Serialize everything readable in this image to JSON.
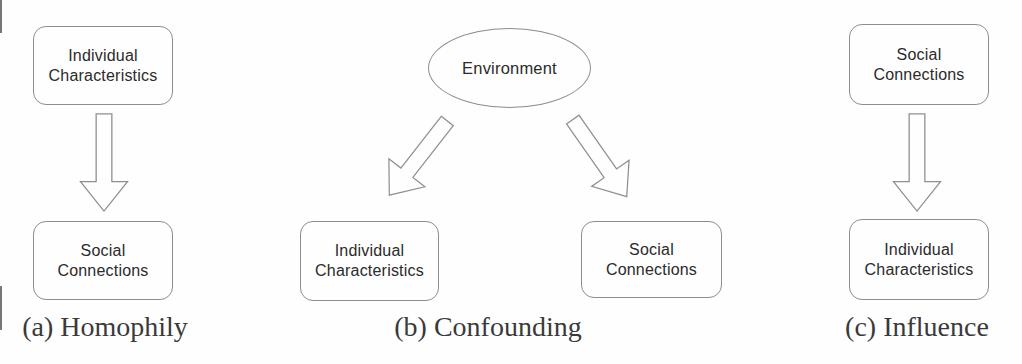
{
  "figure": {
    "description_colors": {
      "border": "#8d8d8d",
      "node_text": "#2b2b2b",
      "caption_text": "#3a3a3a",
      "background": "#fefefe"
    },
    "panels": {
      "homophily": {
        "caption": "(a) Homophily",
        "source_box": {
          "line1": "Individual",
          "line2": "Characteristics"
        },
        "target_box": {
          "line1": "Social",
          "line2": "Connections"
        }
      },
      "confounding": {
        "caption": "(b) Confounding",
        "cause_ellipse": {
          "label": "Environment"
        },
        "left_box": {
          "line1": "Individual",
          "line2": "Characteristics"
        },
        "right_box": {
          "line1": "Social",
          "line2": "Connections"
        }
      },
      "influence": {
        "caption": "(c) Influence",
        "source_box": {
          "line1": "Social",
          "line2": "Connections"
        },
        "target_box": {
          "line1": "Individual",
          "line2": "Characteristics"
        }
      }
    }
  }
}
